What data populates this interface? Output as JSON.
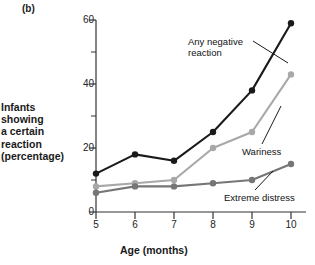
{
  "panel": {
    "label": "(b)"
  },
  "chart_data": {
    "type": "line",
    "title": "",
    "subtitle": "",
    "xlabel": "Age (months)",
    "ylabel": "Infants showing a certain reaction (percentage)",
    "ylabel_lines": [
      "Infants",
      "showing",
      "a certain",
      "reaction",
      "(percentage)"
    ],
    "x": [
      5,
      6,
      7,
      8,
      9,
      10
    ],
    "categories": [
      "5",
      "6",
      "7",
      "8",
      "9",
      "10"
    ],
    "xlim": [
      5,
      10
    ],
    "ylim": [
      0,
      60
    ],
    "yticks": [
      0,
      20,
      40,
      60
    ],
    "ytick_labels": [
      "0",
      "20",
      "40",
      "60"
    ],
    "yticks_minor": [
      10,
      30,
      50
    ],
    "xticks": [
      5,
      6,
      7,
      8,
      9,
      10
    ],
    "xtick_labels": [
      "5",
      "6",
      "7",
      "8",
      "9",
      "10"
    ],
    "grid": false,
    "legend_position": "inline-annotations",
    "series": [
      {
        "name": "Any negative reaction",
        "color": "#1a1a1a",
        "values": [
          12,
          18,
          16,
          25,
          38,
          59
        ]
      },
      {
        "name": "Wariness",
        "color": "#a8a8a8",
        "values": [
          8,
          9,
          10,
          20,
          25,
          43
        ]
      },
      {
        "name": "Extreme distress",
        "color": "#767676",
        "values": [
          6,
          8,
          8,
          9,
          10,
          15
        ]
      }
    ],
    "annotations": [
      {
        "text": "Any negative",
        "series": "Any negative reaction"
      },
      {
        "text": "reaction",
        "series": "Any negative reaction"
      },
      {
        "text": "Wariness",
        "series": "Wariness"
      },
      {
        "text": "Extreme distress",
        "series": "Extreme distress"
      }
    ]
  },
  "axis_colors": {
    "axis_line": "#333333",
    "text": "#1a1a1a"
  }
}
